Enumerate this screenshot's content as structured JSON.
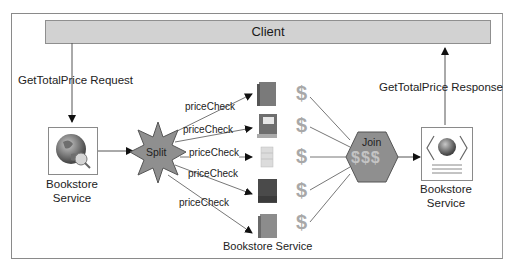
{
  "diagram": {
    "client": {
      "label": "Client"
    },
    "request_label": "GetTotalPrice Request",
    "response_label": "GetTotalPrice Response",
    "left_service": {
      "line1": "Bookstore",
      "line2": "Service",
      "icon": "globe-search-icon"
    },
    "split": {
      "label": "Split",
      "shape": "star"
    },
    "join": {
      "label": "Join",
      "symbols": "$$$",
      "shape": "hexagon"
    },
    "right_service": {
      "line1": "Bookstore",
      "line2": "Service",
      "icon": "web-service-document-icon"
    },
    "price_checks": [
      {
        "label": "priceCheck"
      },
      {
        "label": "priceCheck"
      },
      {
        "label": "priceCheck"
      },
      {
        "label": "priceCheck"
      },
      {
        "label": "priceCheck"
      }
    ],
    "books": [
      {
        "color": "#7a7a7a",
        "icon": "book-icon"
      },
      {
        "color": "#6e6e6e",
        "icon": "open-book-icon"
      },
      {
        "color": "#d8d8d8",
        "icon": "book-stack-icon"
      },
      {
        "color": "#4a4a4a",
        "icon": "book-icon"
      },
      {
        "color": "#8c8c8c",
        "icon": "book-icon"
      }
    ],
    "prices": [
      "$",
      "$",
      "$",
      "$",
      "$"
    ],
    "bookstore_group_label": "Bookstore Service",
    "colors": {
      "shape_fill": "#8f8f8f",
      "line": "#7a7a7a",
      "client_fill": "#d2d2d2",
      "dollar": "#a8a8a8"
    }
  }
}
